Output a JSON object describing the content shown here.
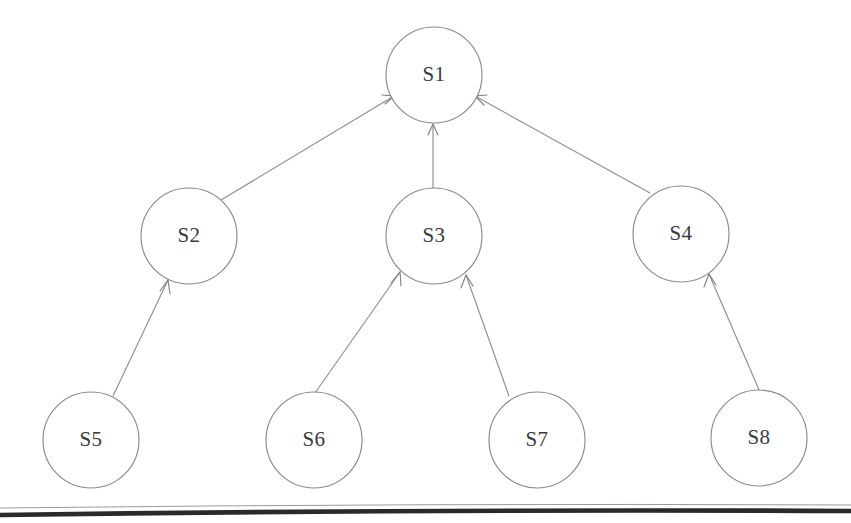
{
  "diagram": {
    "type": "directed-tree",
    "background_color": "#ffffff",
    "node_stroke_color": "#8a8a8a",
    "edge_color": "#8f8f8f",
    "label_color": "#3c3a3a",
    "rule_color": "#2a2a2a",
    "nodes": [
      {
        "id": "S1",
        "label": "S1",
        "cx": 434,
        "cy": 75,
        "r": 48,
        "level": 0
      },
      {
        "id": "S2",
        "label": "S2",
        "cx": 189,
        "cy": 236,
        "r": 48,
        "level": 1
      },
      {
        "id": "S3",
        "label": "S3",
        "cx": 434,
        "cy": 236,
        "r": 48,
        "level": 1
      },
      {
        "id": "S4",
        "label": "S4",
        "cx": 681,
        "cy": 234,
        "r": 48,
        "level": 1
      },
      {
        "id": "S5",
        "label": "S5",
        "cx": 91,
        "cy": 440,
        "r": 48,
        "level": 2
      },
      {
        "id": "S6",
        "label": "S6",
        "cx": 314,
        "cy": 440,
        "r": 48,
        "level": 2
      },
      {
        "id": "S7",
        "label": "S7",
        "cx": 537,
        "cy": 440,
        "r": 48,
        "level": 2
      },
      {
        "id": "S8",
        "label": "S8",
        "cx": 759,
        "cy": 438,
        "r": 48,
        "level": 2
      }
    ],
    "edges": [
      {
        "id": "e-s2-s1",
        "from": "S2",
        "to": "S1",
        "arrow": "to"
      },
      {
        "id": "e-s3-s1",
        "from": "S3",
        "to": "S1",
        "arrow": "to"
      },
      {
        "id": "e-s4-s1",
        "from": "S4",
        "to": "S1",
        "arrow": "to"
      },
      {
        "id": "e-s5-s2",
        "from": "S5",
        "to": "S2",
        "arrow": "to"
      },
      {
        "id": "e-s6-s3",
        "from": "S6",
        "to": "S3",
        "arrow": "to"
      },
      {
        "id": "e-s7-s3",
        "from": "S7",
        "to": "S3",
        "arrow": "to"
      },
      {
        "id": "e-s8-s4",
        "from": "S8",
        "to": "S4",
        "arrow": "to"
      }
    ],
    "footer_rule": {
      "visible": true,
      "y_left": 514,
      "y_right": 511,
      "thickness": 4.6
    }
  }
}
